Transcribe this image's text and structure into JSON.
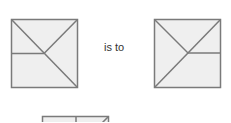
{
  "puzzle": {
    "connector_text": "is to",
    "colors": {
      "fill": "#efefef",
      "stroke": "#7a7a7a",
      "text": "#333333"
    },
    "figures": [
      {
        "name": "figure-a",
        "description": "square with top-left to bottom-right diagonal, line from top-right corner to center, horizontal line from left edge to center"
      },
      {
        "name": "figure-b",
        "description": "square with top-right to bottom-left diagonal, line from top-left corner to center, horizontal line from center to right edge"
      },
      {
        "name": "figure-c",
        "description": "partially visible square with vertical line from top edge and diagonal toward top-right corner"
      }
    ]
  }
}
